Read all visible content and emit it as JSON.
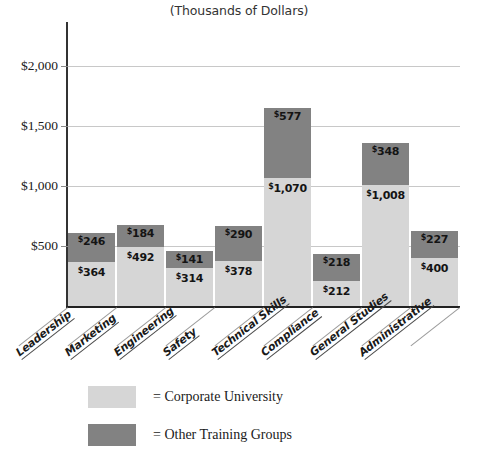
{
  "chart_data": {
    "type": "bar",
    "subtype": "stacked-vertical",
    "title": "(Thousands of Dollars)",
    "xlabel": "",
    "ylabel": "",
    "ylim": [
      0,
      2000
    ],
    "yticks": [
      500,
      1000,
      1500,
      2000
    ],
    "ytick_labels": [
      "$500",
      "$1,000",
      "$1,500",
      "$2,000"
    ],
    "grid": true,
    "legend_position": "bottom-left",
    "categories": [
      "Leadership",
      "Marketing",
      "Engineering",
      "Safety",
      "Technical Skills",
      "Compliance",
      "General Studies",
      "Administrative"
    ],
    "series": [
      {
        "name": "Corporate University",
        "color": "#d6d6d6",
        "values": [
          364,
          492,
          314,
          378,
          1070,
          212,
          1008,
          400
        ],
        "value_labels": [
          "$364",
          "$492",
          "$314",
          "$378",
          "$1,070",
          "$212",
          "$1,008",
          "$400"
        ]
      },
      {
        "name": "Other Training Groups",
        "color": "#828282",
        "values": [
          246,
          184,
          141,
          290,
          577,
          218,
          348,
          227
        ],
        "value_labels": [
          "$246",
          "$184",
          "$141",
          "$290",
          "$577",
          "$218",
          "$348",
          "$227"
        ]
      }
    ],
    "totals": [
      610,
      676,
      455,
      668,
      1647,
      430,
      1356,
      627
    ]
  },
  "legend": {
    "items": [
      {
        "equals": "=",
        "label": "Corporate University",
        "color": "#d6d6d6"
      },
      {
        "equals": "=",
        "label": "Other Training Groups",
        "color": "#828282"
      }
    ]
  }
}
